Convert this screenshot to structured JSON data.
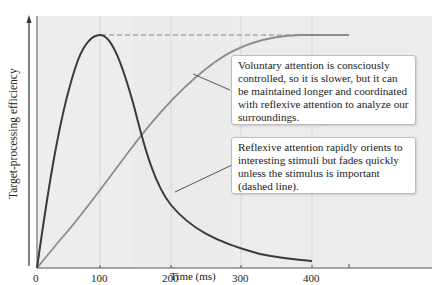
{
  "chart_data": {
    "type": "line",
    "title": "",
    "xlabel": "Time (ms)",
    "ylabel": "Target-processing efficiency",
    "xlim": [
      0,
      450
    ],
    "ylim": [
      0,
      1
    ],
    "x_ticks": [
      "0",
      "100",
      "200",
      "300",
      "400"
    ],
    "grid": "vertical lines at 100, 200, 300, 400",
    "series": [
      {
        "name": "Reflexive attention",
        "color": "#3a3a3a",
        "x": [
          0,
          25,
          50,
          75,
          100,
          125,
          150,
          175,
          200,
          250,
          300,
          350,
          400
        ],
        "values": [
          0,
          0.45,
          0.8,
          0.97,
          1.0,
          0.85,
          0.58,
          0.35,
          0.23,
          0.13,
          0.08,
          0.05,
          0.04
        ]
      },
      {
        "name": "Voluntary attention",
        "color": "#8a8a8a",
        "x": [
          0,
          50,
          100,
          150,
          200,
          250,
          300,
          350,
          400,
          450
        ],
        "values": [
          0,
          0.22,
          0.44,
          0.64,
          0.81,
          0.93,
          0.98,
          0.995,
          1.0,
          1.0
        ]
      },
      {
        "name": "Reflexive attention sustained (dashed)",
        "style": "dashed",
        "color": "#8a8a8a",
        "x": [
          100,
          450
        ],
        "values": [
          1.0,
          1.0
        ]
      }
    ],
    "annotations": [
      "Voluntary attention is consciously controlled, so it is slower, but it can be maintained longer and coordinated with reflexive attention to analyze our surroundings.",
      "Reflexive attention rapidly orients to interesting stimuli but fades quickly unless the stimulus is important (dashed line)."
    ]
  },
  "axes": {
    "xlabel": "Time (ms)",
    "ylabel": "Target-processing efficiency",
    "ticks": [
      "0",
      "100",
      "200",
      "300",
      "400"
    ]
  },
  "callouts": {
    "voluntary": "Voluntary attention is consciously controlled, so it is slower, but it can be maintained longer and coordinated with reflexive attention to analyze our surroundings.",
    "reflexive": "Reflexive attention rapidly orients to interesting stimuli but fades quickly unless the stimulus is important (dashed line)."
  }
}
